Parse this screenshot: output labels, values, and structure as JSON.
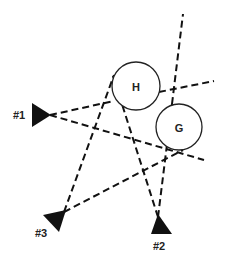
{
  "diagram": {
    "targets": [
      {
        "id": "H",
        "label": "H",
        "cx": 136,
        "cy": 86,
        "r": 24
      },
      {
        "id": "G",
        "label": "G",
        "cx": 179,
        "cy": 127,
        "r": 23
      }
    ],
    "stations": [
      {
        "id": "1",
        "label": "#1",
        "position": "left"
      },
      {
        "id": "2",
        "label": "#2",
        "position": "bottom-right"
      },
      {
        "id": "3",
        "label": "#3",
        "position": "bottom-left"
      }
    ],
    "sight_lines": [
      {
        "from": "#1",
        "to": "H",
        "style": "dashed",
        "note": "continues past H to the right edge"
      },
      {
        "from": "#1",
        "to": "G",
        "style": "dashed",
        "note": "passes below G"
      },
      {
        "from": "#3",
        "to": "H",
        "style": "dashed"
      },
      {
        "from": "#3",
        "to": "G",
        "style": "dashed"
      },
      {
        "from": "#2",
        "to": "H",
        "style": "dashed"
      },
      {
        "from": "#2",
        "to": "G",
        "style": "dashed",
        "note": "continues past G toward top"
      }
    ],
    "colors": {
      "line": "#111111",
      "background": "#ffffff"
    }
  }
}
